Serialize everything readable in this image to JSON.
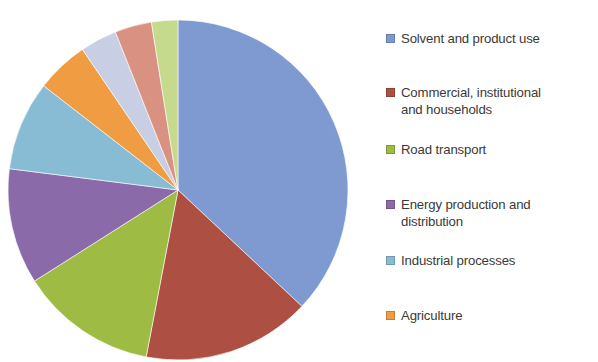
{
  "chart_data": {
    "type": "pie",
    "title": "",
    "subtitle": "",
    "xlabel": "",
    "ylabel": "",
    "legend_position": "right",
    "grid": false,
    "start_angle_deg": 0,
    "direction": "clockwise",
    "categories": [
      "Solvent and product use",
      "Commercial, institutional and households",
      "Road transport",
      "Energy production and distribution",
      "Industrial processes",
      "Agriculture",
      "",
      "",
      ""
    ],
    "values": [
      37,
      16,
      13,
      11,
      8.5,
      5,
      3.5,
      3.5,
      2.5
    ],
    "colors": [
      "#7e9ad1",
      "#ad4f43",
      "#9ebc43",
      "#8a6aa8",
      "#87bcd4",
      "#ef9c42",
      "#c8cfe4",
      "#d99182",
      "#c6da8e"
    ],
    "slices": [
      {
        "label": "Solvent and product use",
        "value": 37,
        "color": "#7e9ad1"
      },
      {
        "label": "Commercial, institutional and households",
        "value": 16,
        "color": "#ad4f43"
      },
      {
        "label": "Road transport",
        "value": 13,
        "color": "#9ebc43"
      },
      {
        "label": "Energy production and distribution",
        "value": 11,
        "color": "#8a6aa8"
      },
      {
        "label": "Industrial processes",
        "value": 8.5,
        "color": "#87bcd4"
      },
      {
        "label": "Agriculture",
        "value": 5,
        "color": "#ef9c42"
      },
      {
        "label": "",
        "value": 3.5,
        "color": "#c8cfe4"
      },
      {
        "label": "",
        "value": 3.5,
        "color": "#d99182"
      },
      {
        "label": "",
        "value": 2.5,
        "color": "#c6da8e"
      }
    ]
  },
  "legend": {
    "items": [
      {
        "label": "Solvent and product use",
        "color": "#7e9ad1",
        "top": 31
      },
      {
        "label": "Commercial, institutional\nand households",
        "color": "#ad4f43",
        "top": 85
      },
      {
        "label": "Road transport",
        "color": "#9ebc43",
        "top": 142
      },
      {
        "label": "Energy production and\ndistribution",
        "color": "#8a6aa8",
        "top": 197
      },
      {
        "label": "Industrial processes",
        "color": "#87bcd4",
        "top": 253
      },
      {
        "label": "Agriculture",
        "color": "#ef9c42",
        "top": 308
      }
    ]
  },
  "pie_geometry": {
    "center_x": 178,
    "center_y": 190,
    "radius": 170
  }
}
